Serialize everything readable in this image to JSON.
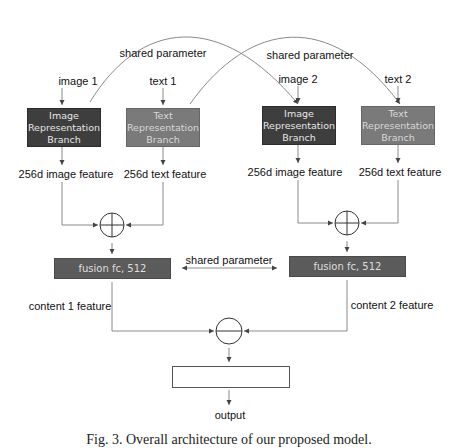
{
  "inputs": {
    "image1": "image 1",
    "text1": "text 1",
    "image2": "image 2",
    "text2": "text 2"
  },
  "branches": {
    "image_branch": "Image Representation Branch",
    "image_branch_lines": [
      "Image",
      "Representation",
      "Branch"
    ],
    "text_branch_lines": [
      "Text",
      "Representation",
      "Branch"
    ]
  },
  "features": {
    "image_feature": "256d image feature",
    "text_feature": "256d text feature"
  },
  "shared_labels": {
    "top_left": "shared parameter",
    "top_right": "shared parameter",
    "middle": "shared parameter"
  },
  "fusion": {
    "left": "fusion fc, 512",
    "right": "fusion fc, 512"
  },
  "content": {
    "left": "content 1 feature",
    "right": "content 2 feature"
  },
  "operators": {
    "add": "plus-operator",
    "subtract": "minus-operator"
  },
  "output": {
    "box_label": "",
    "label": "output"
  },
  "caption": "Fig. 3. Overall architecture of our proposed model.",
  "colors": {
    "image_branch": "#3e3e3e",
    "text_branch": "#7a7a7a",
    "fusion": "#5b5b5b",
    "lines": "#888888"
  }
}
